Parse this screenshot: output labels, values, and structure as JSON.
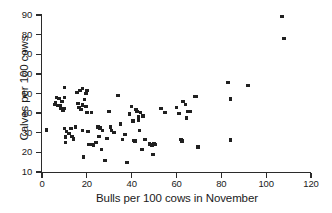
{
  "chart_data": {
    "type": "scatter",
    "title": "",
    "xlabel": "Bulls per 100 cows in November",
    "ylabel": "Calves per 100 cows",
    "xlim": [
      0,
      120
    ],
    "ylim": [
      10,
      90
    ],
    "xticks": [
      0,
      20,
      40,
      60,
      80,
      100,
      120
    ],
    "yticks": [
      10,
      20,
      30,
      40,
      50,
      60,
      70,
      80,
      90
    ],
    "grid": false,
    "legend": null,
    "marker": "square",
    "marker_color": "#202020",
    "points": [
      [
        2,
        31.4
      ],
      [
        5.5,
        44.5
      ],
      [
        6,
        45.5
      ],
      [
        6.5,
        47.8
      ],
      [
        7,
        43.8
      ],
      [
        7.5,
        47.5
      ],
      [
        8,
        44.0
      ],
      [
        8.5,
        42.3
      ],
      [
        9,
        45.8
      ],
      [
        9.5,
        41.3
      ],
      [
        10,
        53.0
      ],
      [
        10,
        48.0
      ],
      [
        10,
        42.5
      ],
      [
        10,
        32.0
      ],
      [
        10.5,
        27.8
      ],
      [
        10.5,
        25.2
      ],
      [
        11,
        30.5
      ],
      [
        12,
        29.5
      ],
      [
        13,
        32.0
      ],
      [
        13.5,
        28.0
      ],
      [
        14,
        26.8
      ],
      [
        15,
        33.0
      ],
      [
        15.5,
        50.5
      ],
      [
        16,
        45.0
      ],
      [
        16.5,
        43.0
      ],
      [
        17,
        51.5
      ],
      [
        17.5,
        41.8
      ],
      [
        18,
        52.5
      ],
      [
        18,
        44.2
      ],
      [
        18,
        31.0
      ],
      [
        18.5,
        17.7
      ],
      [
        19,
        46.8
      ],
      [
        19.5,
        50.0
      ],
      [
        19.5,
        43.5
      ],
      [
        20,
        51.5
      ],
      [
        20,
        40.3
      ],
      [
        20.5,
        30.5
      ],
      [
        21,
        24.0
      ],
      [
        22,
        24.0
      ],
      [
        22,
        40.5
      ],
      [
        23,
        23.8
      ],
      [
        24,
        25.2
      ],
      [
        25,
        33.0
      ],
      [
        25.5,
        28.0
      ],
      [
        26,
        32.5
      ],
      [
        26.5,
        21.3
      ],
      [
        27,
        31.0
      ],
      [
        28,
        16.0
      ],
      [
        29,
        27.0
      ],
      [
        30,
        41.0
      ],
      [
        30.5,
        33.0
      ],
      [
        31,
        31.3
      ],
      [
        32,
        30.0
      ],
      [
        34,
        49.0
      ],
      [
        35,
        34.5
      ],
      [
        36,
        26.5
      ],
      [
        37,
        29.0
      ],
      [
        38,
        14.7
      ],
      [
        39,
        39.5
      ],
      [
        40,
        43.5
      ],
      [
        40.5,
        36.0
      ],
      [
        41,
        26.0
      ],
      [
        41.5,
        25.8
      ],
      [
        42,
        42.0
      ],
      [
        42.5,
        41.0
      ],
      [
        43,
        38.0
      ],
      [
        43,
        36.5
      ],
      [
        43.5,
        31.0
      ],
      [
        44,
        40.5
      ],
      [
        44.5,
        21.3
      ],
      [
        45,
        38.5
      ],
      [
        46,
        26.5
      ],
      [
        48,
        24.3
      ],
      [
        49,
        23.8
      ],
      [
        49.5,
        19.0
      ],
      [
        50,
        24.5
      ],
      [
        50.5,
        24.0
      ],
      [
        53,
        42.5
      ],
      [
        55,
        40.3
      ],
      [
        60,
        43.0
      ],
      [
        61,
        39.8
      ],
      [
        62,
        26.5
      ],
      [
        62.5,
        25.8
      ],
      [
        63,
        46.0
      ],
      [
        64,
        44.5
      ],
      [
        64.5,
        37.5
      ],
      [
        65,
        41.0
      ],
      [
        66,
        40.8
      ],
      [
        68,
        48.5
      ],
      [
        69,
        48.3
      ],
      [
        69.5,
        22.8
      ],
      [
        83,
        55.5
      ],
      [
        84,
        47.5
      ],
      [
        84,
        46.8
      ],
      [
        84,
        26.3
      ],
      [
        92,
        54.0
      ],
      [
        107,
        89.3
      ],
      [
        108,
        78.0
      ]
    ]
  }
}
